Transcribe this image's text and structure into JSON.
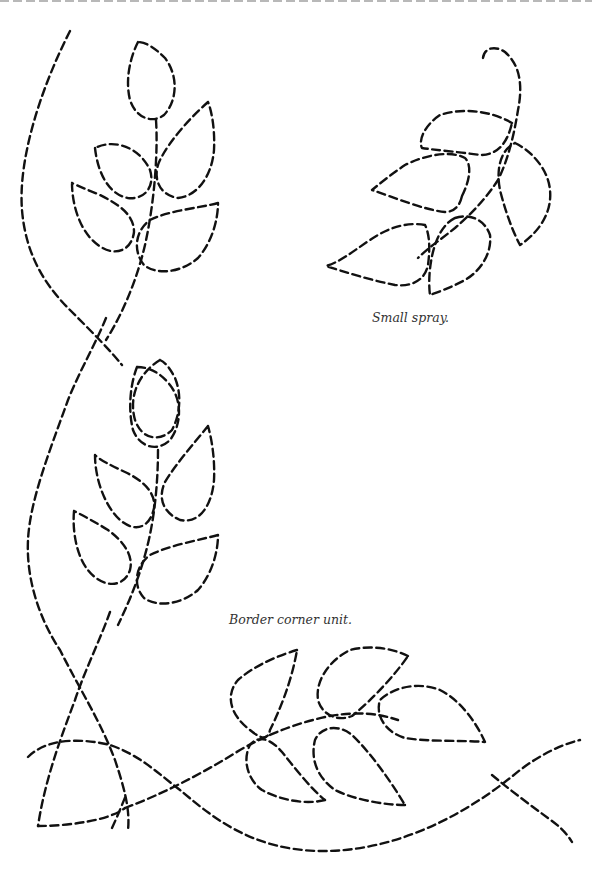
{
  "page": {
    "top_rule": "dashed-separator"
  },
  "captions": {
    "small_spray": "Small spray.",
    "border_corner": "Border corner unit."
  },
  "motifs": [
    {
      "name": "border-corner-vine",
      "description": "Long curving dashed vine with two leaf sprays and a corner loop"
    },
    {
      "name": "small-spray",
      "description": "Curled stem with five teardrop leaves"
    }
  ],
  "colors": {
    "stroke": "#111111",
    "caption": "#333333",
    "top_rule": "#b8b8b8",
    "background": "#ffffff"
  }
}
